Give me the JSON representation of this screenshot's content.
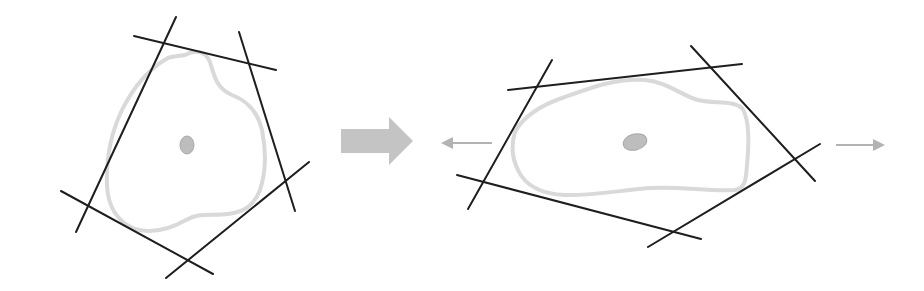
{
  "diagram": {
    "type": "cell-shape-transformation",
    "description_visible": "Cell outline with tangent lines before and after elongation",
    "colors": {
      "tangent_lines": "#1e1e1e",
      "cell_outline": "#d9d9d9",
      "nucleus_fill": "#bdbdbd",
      "transition_arrow": "#c4c4c4",
      "stretch_arrows": "#b3b3b3"
    },
    "panels": [
      {
        "id": "before",
        "label": "",
        "cell_shape": "rounded-pentagonal",
        "tangent_line_count": 5,
        "nucleus_shape": "small-oval-vertical"
      },
      {
        "id": "after",
        "label": "",
        "cell_shape": "elongated-horizontal",
        "tangent_line_count": 4,
        "nucleus_shape": "small-oval-horizontal",
        "stretch_directions": [
          "left",
          "right"
        ]
      }
    ],
    "transition": {
      "icon": "thick-right-arrow-icon",
      "meaning": "transforms-into"
    },
    "icons": {
      "left_stretch": "arrow-left-icon",
      "right_stretch": "arrow-right-icon"
    }
  }
}
